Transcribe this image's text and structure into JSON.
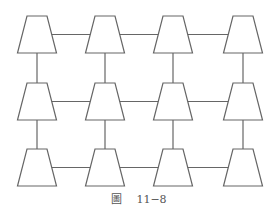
{
  "diagram": {
    "type": "grid-network",
    "rows": 3,
    "columns": 4,
    "node_shape": "trapezoid",
    "line_color": "#666666",
    "node_fill": "#ffffff",
    "column_centers": [
      37,
      105,
      173,
      243
    ],
    "row_tops": [
      16,
      83,
      149
    ],
    "node_height": 37,
    "node_top_width": 20,
    "node_bottom_width": 39,
    "connections": "each node connected to horizontal and vertical neighbors"
  },
  "caption": {
    "label": "圖",
    "number": "11−8"
  }
}
